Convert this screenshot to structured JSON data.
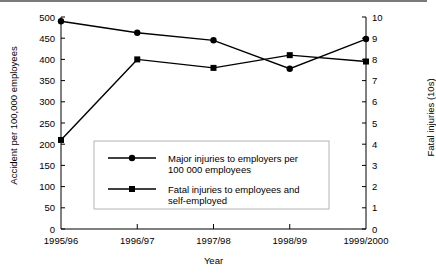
{
  "chart_data": {
    "type": "line",
    "title": "",
    "xlabel": "Year",
    "ylabel": "Accident per 100,000 employees",
    "ylabel_right": "Fatal injuries (10s)",
    "categories": [
      "1995/96",
      "1996/97",
      "1997/98",
      "1998/99",
      "1999/2000"
    ],
    "ylim": [
      0,
      500
    ],
    "yticks": [
      0,
      50,
      100,
      150,
      200,
      250,
      300,
      350,
      400,
      450,
      500
    ],
    "ylim_right": [
      0,
      10
    ],
    "yticks_right": [
      0,
      1,
      2,
      3,
      4,
      5,
      6,
      7,
      8,
      9,
      10
    ],
    "grid": false,
    "legend_position": "inside-lower-center",
    "series": [
      {
        "name": "Major injuries to employers per 100 000 employees",
        "marker": "circle",
        "axis": "left",
        "values": [
          490,
          463,
          445,
          378,
          448
        ]
      },
      {
        "name": "Fatal injuries to employees and self-employed",
        "marker": "square",
        "axis": "right",
        "values": [
          4.2,
          8.0,
          7.6,
          8.2,
          7.9
        ],
        "values_left_scale": [
          210,
          400,
          378,
          410,
          397
        ]
      }
    ],
    "legend": [
      {
        "marker": "circle",
        "line1": "Major injuries to employers per",
        "line2": "100 000 employees"
      },
      {
        "marker": "square",
        "line1": "Fatal injuries to employees and",
        "line2": "self-employed"
      }
    ],
    "colors": {
      "line": "#000000",
      "axis": "#000000",
      "legend_border": "#b4b4b4",
      "top_rule": "#7a7a7a"
    }
  }
}
